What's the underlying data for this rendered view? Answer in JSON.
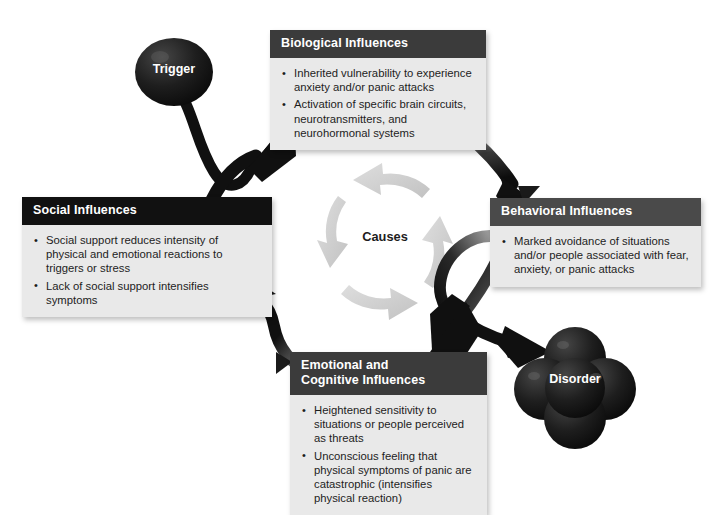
{
  "diagram": {
    "center_label": "Causes",
    "nodes": {
      "trigger": {
        "label": "Trigger",
        "shape": "oval",
        "color": "#1c1c1c"
      },
      "disorder": {
        "label": "Disorder",
        "shape": "four-circle-cluster",
        "color": "#1c1c1c"
      }
    },
    "boxes": [
      {
        "id": "biological",
        "title": "Biological Influences",
        "header_color": "#3b3b3b",
        "body_color": "#e9e9e9",
        "bullets": [
          "Inherited vulnerability to experience anxiety and/or panic attacks",
          "Activation of specific brain circuits, neurotransmitters, and neurohormonal systems"
        ]
      },
      {
        "id": "social",
        "title": "Social Influences",
        "header_color": "#111111",
        "body_color": "#e9e9e9",
        "bullets": [
          "Social support reduces intensity of physical and emotional reactions to triggers or stress",
          "Lack of social support intensifies symptoms"
        ]
      },
      {
        "id": "behavioral",
        "title": "Behavioral Influences",
        "header_color": "#4a4a4a",
        "body_color": "#e9e9e9",
        "bullets": [
          "Marked avoidance of situations and/or people associated with fear, anxiety, or panic attacks"
        ]
      },
      {
        "id": "emotional",
        "title_line1": "Emotional and",
        "title_line2": "Cognitive Influences",
        "header_color": "#3b3b3b",
        "body_color": "#e9e9e9",
        "bullets": [
          "Heightened sensitivity to situations or people perceived as threats",
          "Unconscious feeling that physical symptoms of panic are catastrophic (intensifies physical reaction)"
        ]
      }
    ],
    "arrows": {
      "outer_color": "#111111",
      "inner_ring_color": "#d0d0d0",
      "paths": [
        {
          "name": "trigger-to-biological",
          "from": "trigger",
          "to": "biological"
        },
        {
          "name": "biological-to-behavioral",
          "from": "biological",
          "to": "behavioral"
        },
        {
          "name": "behavioral-to-emotional",
          "from": "behavioral",
          "to": "emotional"
        },
        {
          "name": "behavioral-to-disorder",
          "from": "behavioral",
          "to": "disorder"
        },
        {
          "name": "emotional-to-social",
          "from": "emotional",
          "to": "social"
        },
        {
          "name": "social-to-biological",
          "from": "social",
          "to": "biological"
        }
      ],
      "inner_ring": [
        {
          "name": "ring-arrow-top",
          "direction": "counterclockwise-top"
        },
        {
          "name": "ring-arrow-right",
          "direction": "counterclockwise-right"
        },
        {
          "name": "ring-arrow-bottom",
          "direction": "counterclockwise-bottom"
        },
        {
          "name": "ring-arrow-left",
          "direction": "counterclockwise-left"
        }
      ]
    }
  }
}
